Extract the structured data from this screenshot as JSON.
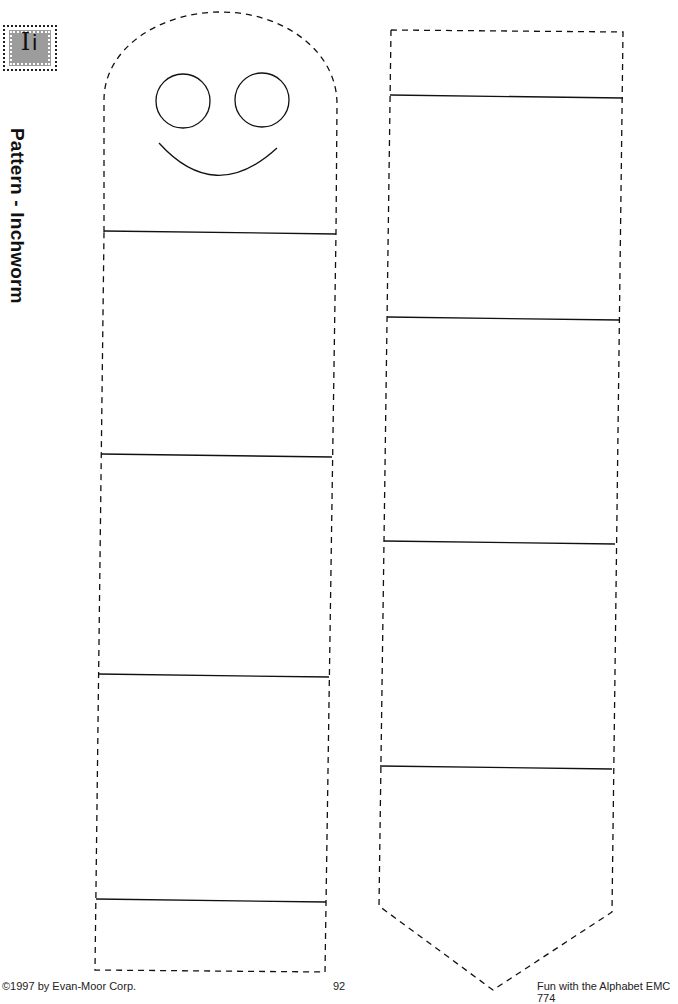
{
  "badge": {
    "upper": "I",
    "lower": "i"
  },
  "title": "Pattern - Inchworm",
  "footer": {
    "copyright": "©1997 by Evan-Moor Corp.",
    "page_number": "92",
    "book": "Fun with the Alphabet EMC 774"
  },
  "colors": {
    "ink": "#111111",
    "badge_fill": "#9c9c9c",
    "paper": "#ffffff"
  },
  "patterns": [
    {
      "name": "inchworm-head-body",
      "segments": 5,
      "features": [
        "left-eye",
        "right-eye",
        "smile"
      ],
      "top": "rounded",
      "cut_line": "dashed",
      "fold_lines": "solid"
    },
    {
      "name": "inchworm-tail-body",
      "segments": 5,
      "top": "flat",
      "bottom": "pointed",
      "cut_line": "dashed",
      "fold_lines": "solid"
    }
  ]
}
